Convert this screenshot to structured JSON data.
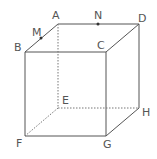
{
  "diagram": {
    "vertices": {
      "A": {
        "label": "A",
        "x": 58,
        "y": 24
      },
      "B": {
        "label": "B",
        "x": 25,
        "y": 52
      },
      "C": {
        "label": "C",
        "x": 106,
        "y": 52
      },
      "D": {
        "label": "D",
        "x": 139,
        "y": 24
      },
      "E": {
        "label": "E",
        "x": 58,
        "y": 108
      },
      "F": {
        "label": "F",
        "x": 25,
        "y": 136
      },
      "G": {
        "label": "G",
        "x": 106,
        "y": 136
      },
      "H": {
        "label": "H",
        "x": 139,
        "y": 108
      }
    },
    "points": {
      "M": {
        "label": "M",
        "on_edge": "AB"
      },
      "N": {
        "label": "N",
        "on_edge": "AD"
      }
    },
    "hidden_edges": [
      "AE",
      "EF",
      "EH"
    ],
    "line_color": "#555555"
  }
}
